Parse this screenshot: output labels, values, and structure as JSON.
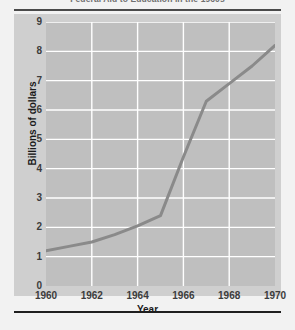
{
  "chart_data": {
    "type": "line",
    "title": "Federal Aid to Education in the 1960s",
    "xlabel": "Year",
    "ylabel": "Billions of dollars",
    "x": [
      1960,
      1961,
      1962,
      1963,
      1964,
      1965,
      1966,
      1967,
      1968,
      1969,
      1970
    ],
    "values": [
      1.2,
      1.35,
      1.5,
      1.75,
      2.05,
      2.4,
      4.4,
      6.3,
      6.9,
      7.5,
      8.2
    ],
    "series": [
      {
        "name": "Federal aid to education",
        "values": [
          1.2,
          1.35,
          1.5,
          1.75,
          2.05,
          2.4,
          4.4,
          6.3,
          6.9,
          7.5,
          8.2
        ]
      }
    ],
    "xlim": [
      1960,
      1970
    ],
    "ylim": [
      0,
      9
    ],
    "x_ticks": [
      "1960",
      "1962",
      "1964",
      "1966",
      "1968",
      "1970"
    ],
    "x_tick_values": [
      1960,
      1962,
      1964,
      1966,
      1968,
      1970
    ],
    "y_ticks": [
      "0",
      "1",
      "2",
      "3",
      "4",
      "5",
      "6",
      "7",
      "8",
      "9"
    ],
    "y_tick_values": [
      0,
      1,
      2,
      3,
      4,
      5,
      6,
      7,
      8,
      9
    ],
    "grid": true,
    "legend": "none",
    "colors": {
      "line": "#8a8a8a",
      "plot_background": "#bfbfbf",
      "panel_background": "#cfcfcf",
      "gridline": "#ffffff",
      "page_background": "#f2f2f2",
      "axis_text": "#1a1a1a",
      "rule": "#4a4a4a"
    }
  },
  "caption": ""
}
